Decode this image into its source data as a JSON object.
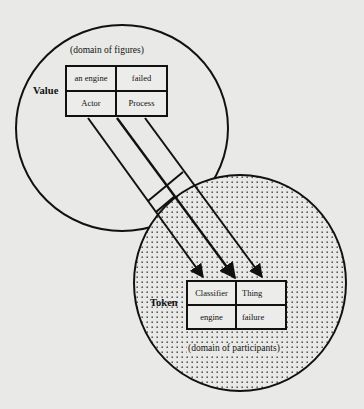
{
  "upper_circle": {
    "domain_label": "(domain of figures)",
    "row_label": "Value",
    "table": {
      "row1": [
        "an engine",
        "failed"
      ],
      "row2": [
        "Actor",
        "Process"
      ]
    }
  },
  "lower_circle": {
    "domain_label": "(domain of participants)",
    "row_label": "Token",
    "table": {
      "row1": [
        "Classifier",
        "Thing"
      ],
      "row2": [
        "engine",
        "failure"
      ]
    },
    "fill": "dotted"
  },
  "arrows": [
    {
      "from": "Actor",
      "to": "Classifier"
    },
    {
      "from": "Actor/Process boundary",
      "to": "Classifier/Thing boundary"
    },
    {
      "from": "Process",
      "to": "Thing"
    }
  ],
  "colors": {
    "background": "#e9e9e7",
    "ink": "#111111"
  }
}
